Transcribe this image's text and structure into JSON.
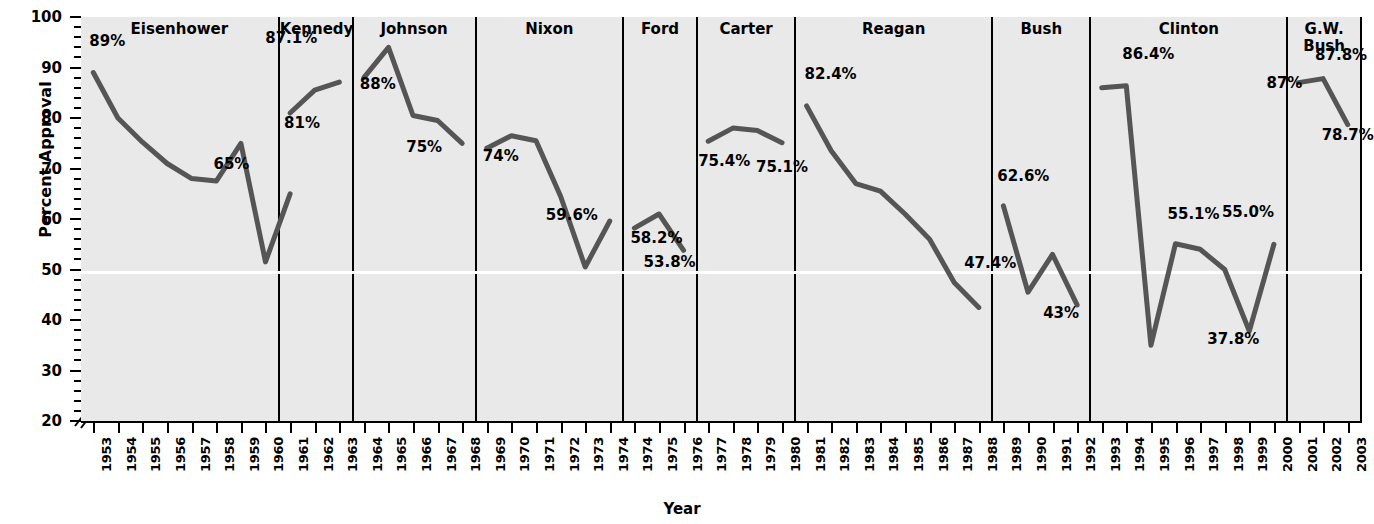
{
  "chart_data": {
    "type": "line",
    "title": "",
    "xlabel": "Year",
    "ylabel": "Percent Approval",
    "ylim": [
      20,
      100
    ],
    "ytick_labels": [
      "100",
      "90",
      "80",
      "70",
      "60",
      "50",
      "40",
      "30",
      "20"
    ],
    "ytick_values": [
      100,
      90,
      80,
      70,
      60,
      50,
      40,
      30,
      20
    ],
    "yaxis_break": true,
    "grid": false,
    "reference_line": 50,
    "legend": "none",
    "panels": [
      {
        "name": "Eisenhower",
        "x": [
          1953,
          1954,
          1955,
          1956,
          1957,
          1958,
          1959,
          1960
        ],
        "y": [
          89,
          80,
          75.2,
          71,
          68,
          67.5,
          75,
          51.5
        ],
        "y_extra": [
          65
        ],
        "values": [
          89,
          80,
          75.2,
          71,
          68,
          67.5,
          75,
          51.5,
          65
        ],
        "labels": [
          {
            "text": "89%",
            "value": 89,
            "year": 1953
          },
          {
            "text": "65%",
            "value": 65,
            "year": 1960
          }
        ]
      },
      {
        "name": "Kennedy",
        "x": [
          1961,
          1962,
          1963
        ],
        "values": [
          81,
          85.5,
          87.1
        ],
        "labels": [
          {
            "text": "87.1%",
            "value": 87.1,
            "year": 1963
          },
          {
            "text": "81%",
            "value": 81,
            "year": 1961
          }
        ]
      },
      {
        "name": "Johnson",
        "x": [
          1964,
          1965,
          1966,
          1967,
          1968
        ],
        "values": [
          88,
          94,
          80.5,
          79.5,
          75
        ],
        "labels": [
          {
            "text": "88%",
            "value": 88,
            "year": 1964
          },
          {
            "text": "75%",
            "value": 75,
            "year": 1968
          }
        ]
      },
      {
        "name": "Nixon",
        "x": [
          1969,
          1970,
          1971,
          1972,
          1973,
          1974
        ],
        "values": [
          74,
          76.5,
          75.5,
          64.5,
          50.5,
          59.6
        ],
        "labels": [
          {
            "text": "74%",
            "value": 74,
            "year": 1969
          },
          {
            "text": "59.6%",
            "value": 59.6,
            "year": 1974
          }
        ]
      },
      {
        "name": "Ford",
        "x": [
          1974,
          1975,
          1976
        ],
        "values": [
          58.2,
          61,
          53.8
        ],
        "labels": [
          {
            "text": "58.2%",
            "value": 58.2,
            "year": 1974
          },
          {
            "text": "53.8%",
            "value": 53.8,
            "year": 1976
          }
        ]
      },
      {
        "name": "Carter",
        "x": [
          1977,
          1978,
          1979,
          1980
        ],
        "values": [
          75.4,
          78,
          77.5,
          75.1
        ],
        "labels": [
          {
            "text": "75.4%",
            "value": 75.4,
            "year": 1977
          },
          {
            "text": "75.1%",
            "value": 75.1,
            "year": 1980
          }
        ]
      },
      {
        "name": "Reagan",
        "x": [
          1981,
          1982,
          1983,
          1984,
          1985,
          1986,
          1987,
          1988
        ],
        "values": [
          82.4,
          73.5,
          67,
          65.5,
          61,
          56,
          47.4,
          42.5
        ],
        "y_extra": [
          46
        ],
        "labels": [
          {
            "text": "82.4%",
            "value": 82.4,
            "year": 1981
          },
          {
            "text": "47.4%",
            "value": 47.4,
            "year": 1987
          }
        ]
      },
      {
        "name": "Bush",
        "x": [
          1989,
          1990,
          1991,
          1992
        ],
        "values": [
          62.6,
          45.5,
          53,
          43
        ],
        "labels": [
          {
            "text": "62.6%",
            "value": 62.6,
            "year": 1989
          },
          {
            "text": "43%",
            "value": 43,
            "year": 1992
          }
        ]
      },
      {
        "name": "Clinton",
        "x": [
          1993,
          1994,
          1995,
          1996,
          1997,
          1998,
          1999,
          2000
        ],
        "values": [
          86,
          86.4,
          35,
          55.1,
          54,
          50,
          37.8,
          55.0
        ],
        "labels": [
          {
            "text": "86.4%",
            "value": 86.4,
            "year": 1994
          },
          {
            "text": "55.1%",
            "value": 55.1,
            "year": 1996
          },
          {
            "text": "55.0%",
            "value": 55.0,
            "year": 2000
          },
          {
            "text": "37.8%",
            "value": 37.8,
            "year": 1999
          }
        ]
      },
      {
        "name": "G.W. Bush",
        "x": [
          2001,
          2002,
          2003
        ],
        "values": [
          87,
          87.8,
          78.7
        ],
        "labels": [
          {
            "text": "87.8%",
            "value": 87.8,
            "year": 2002
          },
          {
            "text": "87%",
            "value": 87,
            "year": 2001
          },
          {
            "text": "78.7%",
            "value": 78.7,
            "year": 2003
          }
        ]
      }
    ]
  },
  "colors": {
    "line": "#555555",
    "panel_background": "#e9e9e9",
    "axis": "#000000",
    "reference_line": "#ffffff"
  }
}
